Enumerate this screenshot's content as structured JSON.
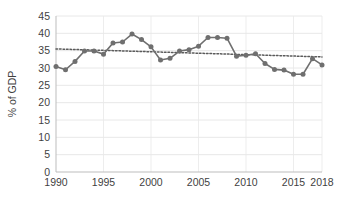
{
  "chart_data": {
    "type": "line",
    "title": "",
    "subtitle": "",
    "xlabel": "",
    "ylabel": "% of GDP",
    "xlim": [
      1990,
      2018
    ],
    "ylim": [
      0,
      45
    ],
    "ytick_step": 5,
    "grid": true,
    "legend": "none",
    "marker": "circle",
    "series_color": "#6f6f6f",
    "trendline_color": "#5a5a5a",
    "trendline_style": "dotted",
    "x": [
      1990,
      1991,
      1992,
      1993,
      1994,
      1995,
      1996,
      1997,
      1998,
      1999,
      2000,
      2001,
      2002,
      2003,
      2004,
      2005,
      2006,
      2007,
      2008,
      2009,
      2010,
      2011,
      2012,
      2013,
      2014,
      2015,
      2016,
      2017,
      2018
    ],
    "series": [
      {
        "name": "% of GDP",
        "values": [
          30.4,
          29.5,
          31.9,
          34.9,
          34.9,
          34.0,
          37.2,
          37.5,
          39.8,
          38.2,
          36.1,
          32.3,
          32.8,
          34.9,
          35.3,
          36.3,
          38.8,
          38.8,
          38.6,
          33.4,
          33.7,
          34.1,
          31.3,
          29.6,
          29.4,
          28.2,
          28.2,
          32.7,
          30.9
        ]
      }
    ],
    "trendline": {
      "name": "linear trend",
      "x": [
        1990,
        2018
      ],
      "values": [
        35.5,
        33.2
      ]
    },
    "xticks": [
      "1990",
      "1995",
      "2000",
      "2005",
      "2010",
      "2015",
      "2018"
    ],
    "xtick_values": [
      1990,
      1995,
      2000,
      2005,
      2010,
      2015,
      2018
    ],
    "yticks": [
      "0",
      "5",
      "10",
      "15",
      "20",
      "25",
      "30",
      "35",
      "40",
      "45"
    ],
    "ytick_values": [
      0,
      5,
      10,
      15,
      20,
      25,
      30,
      35,
      40,
      45
    ]
  },
  "plot_area": {
    "left": 56,
    "top": 16,
    "right": 322,
    "bottom": 172
  }
}
